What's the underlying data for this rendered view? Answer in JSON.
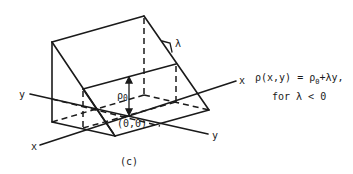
{
  "figure": {
    "caption": "(c)",
    "labels": {
      "lambda": "λ",
      "rho0": "ρ",
      "rho0_sub": "0",
      "origin": "(0,0)",
      "x_axis_front": "x",
      "x_axis_back": "x",
      "y_axis_left": "y",
      "y_axis_right": "y"
    },
    "equation": {
      "line1_prefix": "ρ(x,y) = ρ",
      "line1_sub": "0",
      "line1_suffix": "+λy,",
      "line2": "for λ < 0"
    },
    "colors": {
      "stroke": "#1a1a1a",
      "background": "#ffffff"
    }
  }
}
